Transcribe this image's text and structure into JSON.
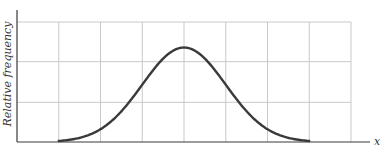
{
  "chart_data": {
    "type": "line",
    "title": "",
    "xlabel": "x",
    "ylabel": "Relative frequency",
    "grid": true,
    "legend": "none",
    "x_ticks": [],
    "y_ticks": [],
    "xlim": [
      -4,
      4
    ],
    "ylim": [
      0,
      1.27
    ],
    "grid_x": [
      -3,
      -2,
      -1,
      0,
      1,
      2,
      3,
      4
    ],
    "grid_y": [
      0.42,
      0.85,
      1.27
    ],
    "series": [
      {
        "name": "normal distribution curve",
        "function": "gaussian",
        "mean": 0,
        "sd": 1,
        "peak": 1.0,
        "x_start": -3,
        "x_end": 3
      }
    ]
  }
}
